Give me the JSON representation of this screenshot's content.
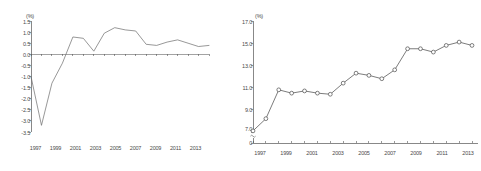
{
  "figure": {
    "panels": [
      {
        "id": "left",
        "unit_label": "(%)",
        "y_ticks": [
          "1.5",
          "1.0",
          "0.5",
          "0.0",
          "-0.5",
          "-1.0",
          "-1.5",
          "-2.0",
          "-2.5",
          "-3.0",
          "-3.5"
        ],
        "x_ticks": [
          "1997",
          "1999",
          "2001",
          "2003",
          "2005",
          "2007",
          "2009",
          "2011",
          "2013"
        ]
      },
      {
        "id": "right",
        "unit_label": "(%)",
        "y_ticks": [
          "17.0",
          "15.0",
          "13.0",
          "11.0",
          "9.0",
          "7.0",
          "0"
        ],
        "x_ticks": [
          "1997",
          "1999",
          "2001",
          "2003",
          "2005",
          "2007",
          "2009",
          "2011",
          "2013"
        ]
      }
    ]
  },
  "chart_data": [
    {
      "type": "line",
      "id": "left-chart",
      "title": "",
      "xlabel": "",
      "ylabel": "(%)",
      "ylim": [
        -3.5,
        1.5
      ],
      "xlim": [
        1997,
        2014
      ],
      "grid": false,
      "legend": "none",
      "markers": false,
      "zero_line": true,
      "x": [
        1997,
        1998,
        1999,
        2000,
        2001,
        2002,
        2003,
        2004,
        2005,
        2006,
        2007,
        2008,
        2009,
        2010,
        2011,
        2012,
        2013,
        2014
      ],
      "values": [
        -1.0,
        -3.2,
        -1.3,
        -0.4,
        0.78,
        0.72,
        0.14,
        0.95,
        1.2,
        1.1,
        1.05,
        0.45,
        0.4,
        0.55,
        0.65,
        0.5,
        0.35,
        0.4
      ],
      "tick_labels_x": [
        "1997",
        "1999",
        "2001",
        "2003",
        "2005",
        "2007",
        "2009",
        "2011",
        "2013"
      ],
      "tick_labels_y": [
        "1.5",
        "1.0",
        "0.5",
        "0.0",
        "-0.5",
        "-1.0",
        "-1.5",
        "-2.0",
        "-2.5",
        "-3.0",
        "-3.5"
      ]
    },
    {
      "type": "line",
      "id": "right-chart",
      "title": "",
      "xlabel": "",
      "ylabel": "(%)",
      "ylim": [
        7.0,
        17.0
      ],
      "xlim": [
        1997,
        2014
      ],
      "grid": false,
      "legend": "none",
      "markers": true,
      "axis_break": true,
      "x": [
        1997,
        1998,
        1999,
        2000,
        2001,
        2002,
        2003,
        2004,
        2005,
        2006,
        2007,
        2008,
        2009,
        2010,
        2011,
        2012,
        2013,
        2014
      ],
      "values": [
        7.1,
        8.2,
        10.8,
        10.5,
        10.7,
        10.5,
        10.4,
        11.4,
        12.3,
        12.1,
        11.8,
        12.6,
        14.5,
        14.5,
        14.2,
        14.8,
        15.1,
        14.8
      ],
      "tick_labels_x": [
        "1997",
        "1999",
        "2001",
        "2003",
        "2005",
        "2007",
        "2009",
        "2011",
        "2013"
      ],
      "tick_labels_y": [
        "17.0",
        "15.0",
        "13.0",
        "11.0",
        "9.0",
        "7.0",
        "0"
      ]
    }
  ]
}
